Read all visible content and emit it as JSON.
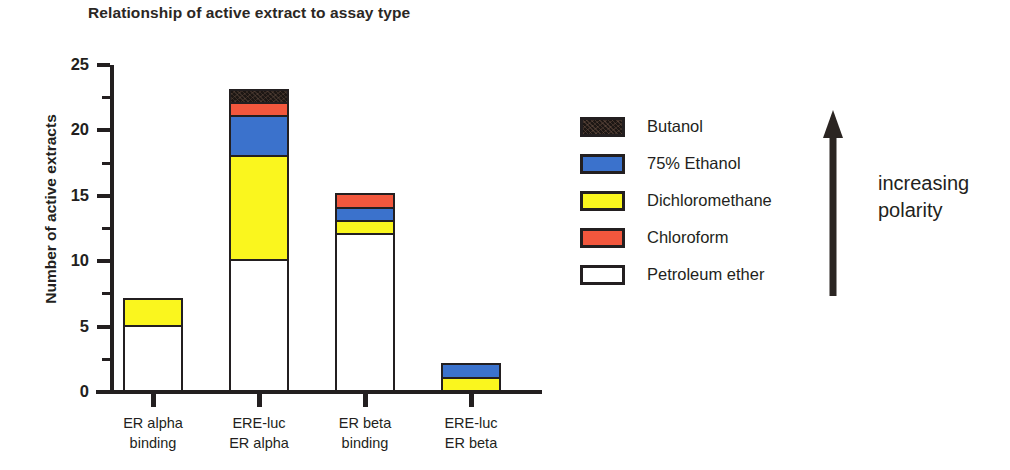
{
  "chart_data": {
    "type": "bar",
    "subtype": "stacked-vertical",
    "title": "Relationship of active extract to assay type",
    "xlabel": "",
    "ylabel": "Number of active extracts",
    "ylim": [
      0,
      25
    ],
    "ytick_labels": [
      "0",
      "5",
      "10",
      "15",
      "20",
      "25"
    ],
    "ytick_values": [
      0,
      5,
      10,
      15,
      20,
      25
    ],
    "minor_tick_interval": 2.5,
    "grid": false,
    "legend_position": "right",
    "categories": [
      {
        "line1": "ER alpha",
        "line2": "binding"
      },
      {
        "line1": "ERE-luc",
        "line2": "ER alpha"
      },
      {
        "line1": "ER beta",
        "line2": "binding"
      },
      {
        "line1": "ERE-luc",
        "line2": "ER beta"
      }
    ],
    "category_labels": [
      "ER alpha binding",
      "ERE-luc ER alpha",
      "ER beta binding",
      "ERE-luc ER beta"
    ],
    "series": [
      {
        "name": "Petroleum ether",
        "color": "#ffffff",
        "values": [
          5,
          10,
          12,
          0
        ]
      },
      {
        "name": "Dichloromethane",
        "color": "#faf61e",
        "values": [
          2,
          8,
          1,
          1
        ]
      },
      {
        "name": "75% Ethanol",
        "color": "#3b72cc",
        "values": [
          0,
          3,
          1,
          1
        ]
      },
      {
        "name": "Chloroform",
        "color": "#f2573d",
        "values": [
          0,
          1,
          1,
          0
        ]
      },
      {
        "name": "Butanol",
        "color": "#1d1714",
        "values": [
          0,
          1,
          0,
          0
        ]
      }
    ],
    "totals": [
      7,
      23,
      15,
      2
    ],
    "stack_order_bottom_to_top": [
      "Petroleum ether",
      "Dichloromethane",
      "75% Ethanol",
      "Chloroform",
      "Butanol"
    ]
  },
  "legend": {
    "items": [
      {
        "label": "Butanol",
        "swatch": "butanol"
      },
      {
        "label": "75% Ethanol",
        "swatch": "ethanol"
      },
      {
        "label": "Dichloromethane",
        "swatch": "dichloro"
      },
      {
        "label": "Chloroform",
        "swatch": "chloroform"
      },
      {
        "label": "Petroleum ether",
        "swatch": "petroleum"
      }
    ]
  },
  "annotation": {
    "arrow_direction": "up",
    "line1": "increasing",
    "line2": "polarity"
  }
}
